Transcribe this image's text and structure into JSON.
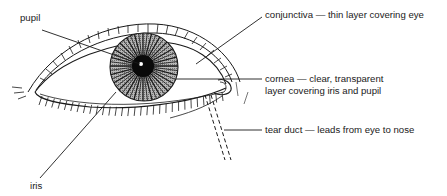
{
  "diagram": {
    "line_color": "#1a1a1a",
    "iris_fill": "#9a9a9a",
    "pupil_fill": "#0a0a0a",
    "labels": {
      "pupil": "pupil",
      "iris": "iris",
      "conjunctiva": "conjunctiva — thin layer covering eye",
      "cornea_line1": "cornea — clear, transparent",
      "cornea_line2": "layer covering iris and pupil",
      "tear_duct": "tear duct — leads from eye to nose"
    }
  }
}
